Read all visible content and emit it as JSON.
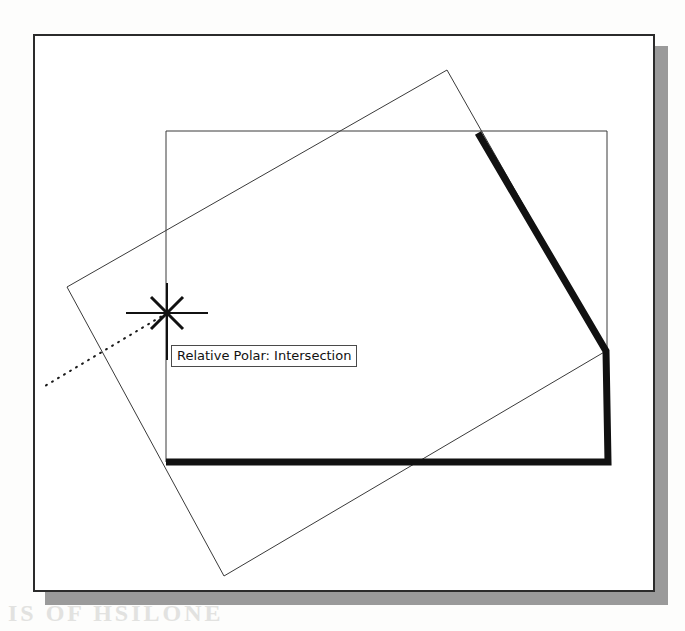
{
  "figure": {
    "kind": "cad-drawing-screenshot",
    "background_color": "#fdfdfc",
    "frame": {
      "border_color": "#2b2b2b",
      "fill_color": "#ffffff",
      "shadow_color": "#9a9a9a",
      "x": 33,
      "y": 34,
      "width": 622,
      "height": 558
    }
  },
  "tooltip": {
    "label": "Relative Polar: Intersection",
    "background_color": "#ffffff",
    "border_color": "#4a4a4a",
    "text_color": "#121212",
    "x": 171,
    "y": 345
  },
  "cursor": {
    "name": "crosshair-with-intersection-snap",
    "center_x": 167,
    "center_y": 313,
    "snap_marker": "x-shaped-intersection-marker",
    "horizontal_arm": [
      126,
      208
    ],
    "vertical_arm": [
      283,
      360
    ],
    "color": "#111111"
  },
  "tracking_line": {
    "name": "polar-tracking-dotted-line",
    "style": "dotted",
    "color": "#1a1a1a",
    "from_x": 167,
    "from_y": 313,
    "to_x": 45,
    "to_y": 386
  },
  "shapes": [
    {
      "name": "axis-aligned-rectangle",
      "stroke": "#3a3a3a",
      "stroke_width": 1,
      "points": "166,131 607,131 607,462 166,462"
    },
    {
      "name": "rotated-rectangle",
      "stroke": "#3a3a3a",
      "stroke_width": 1,
      "points": "67,287 447,70 606,351 224,576"
    },
    {
      "name": "highlighted-polyline",
      "stroke": "#111111",
      "stroke_width": 7,
      "points": "478,133 606,351 608,462 166,462"
    }
  ],
  "bleed_text": {
    "line1": "IS OF HSILONE",
    "line2": "DRAWING",
    "line3": "TOOLS",
    "line4": "figure"
  }
}
